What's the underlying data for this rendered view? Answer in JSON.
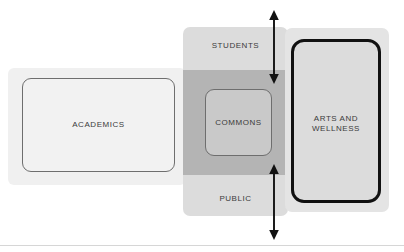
{
  "diagram": {
    "zones": [
      {
        "key": "academics",
        "label": "ACADEMICS",
        "halo_color": "#f0f0f0",
        "fill_color": "#f2f2f2",
        "border_color": "#6e6e6e"
      },
      {
        "key": "students",
        "label": "STUDENTS",
        "fill_color": "#dcdcdc",
        "border_color": "none"
      },
      {
        "key": "public",
        "label": "PUBLIC",
        "fill_color": "#dcdcdc",
        "border_color": "none"
      },
      {
        "key": "commons",
        "label": "COMMONS",
        "fill_color": "#c9c9c9",
        "border_color": "#6e6e6e"
      },
      {
        "key": "arts_and_wellness",
        "label": "ARTS AND\nWELLNESS",
        "halo_color": "#e4e4e4",
        "fill_color": "#dcdcdc",
        "border_color": "#111111"
      }
    ],
    "overlap_band": {
      "key": "overlap",
      "fill_color": "#b4b4b4"
    },
    "arrows": [
      {
        "key": "arrow-top",
        "style": "double-headed-vertical",
        "color": "#111111"
      },
      {
        "key": "arrow-bottom",
        "style": "double-headed-vertical",
        "color": "#111111"
      }
    ],
    "footer_rule_color": "#d6d6d6"
  }
}
